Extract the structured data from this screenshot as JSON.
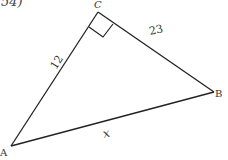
{
  "problem": {
    "number_label": "54)"
  },
  "triangle": {
    "vertices": {
      "A": {
        "label": "A",
        "x": 11,
        "y": 146
      },
      "B": {
        "label": "B",
        "x": 214,
        "y": 92
      },
      "C": {
        "label": "C",
        "x": 98,
        "y": 12
      }
    },
    "sides": {
      "AC": {
        "label": "12"
      },
      "CB": {
        "label": "23"
      },
      "AB": {
        "label": "x"
      }
    },
    "right_angle_at": "C",
    "stroke_color": "#222222"
  }
}
